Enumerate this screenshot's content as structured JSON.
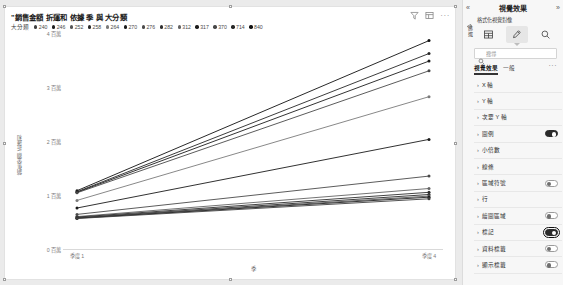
{
  "visual": {
    "title": "\"銷售金額 折運和 依據 季 與 大分類",
    "header_icons": [
      "filter-icon",
      "focus-mode-icon",
      "more-options-icon"
    ],
    "legend": {
      "title": "大分類",
      "items": [
        {
          "label": "240",
          "color": "#3f3f3f"
        },
        {
          "label": "246",
          "color": "#1e1e1e"
        },
        {
          "label": "252",
          "color": "#555555"
        },
        {
          "label": "258",
          "color": "#2a2a2a"
        },
        {
          "label": "264",
          "color": "#7a7a7a"
        },
        {
          "label": "270",
          "color": "#1a1a1a"
        },
        {
          "label": "276",
          "color": "#4a4a4a"
        },
        {
          "label": "282",
          "color": "#2f2f2f"
        },
        {
          "label": "312",
          "color": "#636363"
        },
        {
          "label": "317",
          "color": "#1c1c1c"
        },
        {
          "label": "370",
          "color": "#484848"
        },
        {
          "label": "714",
          "color": "#262626"
        },
        {
          "label": "840",
          "color": "#101010"
        }
      ]
    }
  },
  "chart_data": {
    "type": "line",
    "title": "\"銷售金額 折運和 依據 季 與 大分類",
    "xlabel": "季",
    "ylabel": "銷售金額 折運和",
    "legend_title": "大分類",
    "legend_position": "top",
    "grid": false,
    "x": [
      "季度 1",
      "季度 4"
    ],
    "x_tick_labels": [
      "季度 1",
      "季度 4"
    ],
    "y_tick_labels": [
      "0 百萬",
      "1 百萬",
      "2 百萬",
      "3 百萬",
      "4 百萬"
    ],
    "ylim": [
      0,
      4000000
    ],
    "series": [
      {
        "name": "840",
        "color": "#101010",
        "values": [
          1080000,
          3860000
        ]
      },
      {
        "name": "714",
        "color": "#262626",
        "values": [
          1060000,
          3620000
        ]
      },
      {
        "name": "317",
        "color": "#1c1c1c",
        "values": [
          1050000,
          3480000
        ]
      },
      {
        "name": "370",
        "color": "#484848",
        "values": [
          1040000,
          3300000
        ]
      },
      {
        "name": "264",
        "color": "#7a7a7a",
        "values": [
          900000,
          2820000
        ]
      },
      {
        "name": "270",
        "color": "#1a1a1a",
        "values": [
          760000,
          2030000
        ]
      },
      {
        "name": "276",
        "color": "#4a4a4a",
        "values": [
          640000,
          1350000
        ]
      },
      {
        "name": "312",
        "color": "#636363",
        "values": [
          600000,
          1120000
        ]
      },
      {
        "name": "282",
        "color": "#2f2f2f",
        "values": [
          590000,
          1050000
        ]
      },
      {
        "name": "258",
        "color": "#2a2a2a",
        "values": [
          580000,
          1010000
        ]
      },
      {
        "name": "252",
        "color": "#555555",
        "values": [
          575000,
          980000
        ]
      },
      {
        "name": "246",
        "color": "#1e1e1e",
        "values": [
          570000,
          960000
        ]
      },
      {
        "name": "240",
        "color": "#3f3f3f",
        "values": [
          565000,
          930000
        ]
      }
    ]
  },
  "panel": {
    "title": "視覺效果",
    "subtitle": "格式化視覺對像",
    "collapse_left_label": "«",
    "collapse_right_label": "»",
    "rail_label": "篩選",
    "tabs": [
      {
        "name": "build-visual-tab",
        "icon": "table-chart-icon",
        "selected": false
      },
      {
        "name": "format-visual-tab",
        "icon": "paint-brush-icon",
        "selected": true
      },
      {
        "name": "analytics-tab",
        "icon": "magnifier-icon",
        "selected": false
      }
    ],
    "search": {
      "placeholder": "搜尋",
      "value": ""
    },
    "subtabs": [
      {
        "label": "視覺效果",
        "active": true
      },
      {
        "label": "一般",
        "active": false
      }
    ],
    "subtab_more": "···",
    "properties": [
      {
        "label": "X 軸",
        "chevron": "›",
        "toggle": "none",
        "focused": false
      },
      {
        "label": "Y 軸",
        "chevron": "›",
        "toggle": "none",
        "focused": false
      },
      {
        "label": "次要 Y 軸",
        "chevron": "›",
        "toggle": "none",
        "focused": false
      },
      {
        "label": "圖例",
        "chevron": "›",
        "toggle": "on",
        "focused": false
      },
      {
        "label": "小倍數",
        "chevron": "›",
        "toggle": "none",
        "focused": false
      },
      {
        "label": "線條",
        "chevron": "›",
        "toggle": "none",
        "focused": false
      },
      {
        "label": "區域符號",
        "chevron": "›",
        "toggle": "off",
        "focused": false
      },
      {
        "label": "行",
        "chevron": "›",
        "toggle": "none",
        "focused": false
      },
      {
        "label": "繪圖區域",
        "chevron": "›",
        "toggle": "off",
        "focused": false
      },
      {
        "label": "標記",
        "chevron": "›",
        "toggle": "on",
        "focused": true
      },
      {
        "label": "資料標籤",
        "chevron": "›",
        "toggle": "off",
        "focused": false
      },
      {
        "label": "顯示標籤",
        "chevron": "›",
        "toggle": "off",
        "focused": false
      }
    ]
  }
}
